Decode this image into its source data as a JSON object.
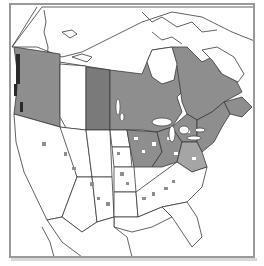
{
  "map": {
    "subject": "North America distribution map",
    "colors": {
      "shaded": "#8e8e8e",
      "shaded_dark": "#7a7a7a",
      "land": "#ffffff",
      "border": "#3a3a3a",
      "frame": "#9a9a9a"
    },
    "shaded_regions": [
      "British Columbia",
      "Saskatchewan",
      "Manitoba",
      "Ontario",
      "Quebec",
      "New Brunswick",
      "Nova Scotia",
      "Great Lakes states",
      "Northeastern United States",
      "Midwestern United States (patchy)"
    ],
    "unshaded_regions": [
      "Alberta",
      "Yukon",
      "Northwest Territories",
      "Nunavut",
      "Labrador",
      "Western United States",
      "Southeastern United States",
      "Mexico"
    ]
  }
}
